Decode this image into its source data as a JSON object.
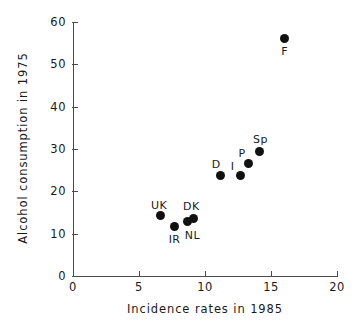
{
  "chart_data": {
    "type": "scatter",
    "title": "",
    "xlabel": "Incidence rates  in 1985",
    "ylabel": "Alcohol consumption in 1975",
    "xlim": [
      0,
      20
    ],
    "ylim": [
      0,
      60
    ],
    "xticks": [
      0,
      5,
      10,
      15,
      20
    ],
    "yticks": [
      0,
      10,
      20,
      30,
      40,
      50,
      60
    ],
    "xtick_labels": [
      "0",
      "5",
      "10",
      "15",
      "20"
    ],
    "ytick_labels": [
      "0",
      "10",
      "20",
      "30",
      "40",
      "50",
      "60"
    ],
    "grid": false,
    "legend": "none",
    "marker": "filled-circle",
    "marker_color": "#111111",
    "axis_color": "#4a4a4a",
    "background": "#ffffff",
    "points": [
      {
        "label": "UK",
        "x": 6.6,
        "y": 14.2,
        "label_dx": -9,
        "label_dy": -17
      },
      {
        "label": "IR",
        "x": 7.7,
        "y": 11.8,
        "label_dx": -6,
        "label_dy": 7
      },
      {
        "label": "NL",
        "x": 8.7,
        "y": 12.8,
        "label_dx": -3,
        "label_dy": 7
      },
      {
        "label": "DK",
        "x": 9.1,
        "y": 13.6,
        "label_dx": -10,
        "label_dy": -18
      },
      {
        "label": "D",
        "x": 11.2,
        "y": 23.8,
        "label_dx": -9,
        "label_dy": -17
      },
      {
        "label": "I",
        "x": 12.7,
        "y": 23.7,
        "label_dx": -10,
        "label_dy": -16
      },
      {
        "label": "P",
        "x": 13.3,
        "y": 26.5,
        "label_dx": -10,
        "label_dy": -17
      },
      {
        "label": "Sp",
        "x": 14.1,
        "y": 29.5,
        "label_dx": -6,
        "label_dy": -18
      },
      {
        "label": "F",
        "x": 16.0,
        "y": 56.0,
        "label_dx": -3,
        "label_dy": 6
      }
    ]
  }
}
